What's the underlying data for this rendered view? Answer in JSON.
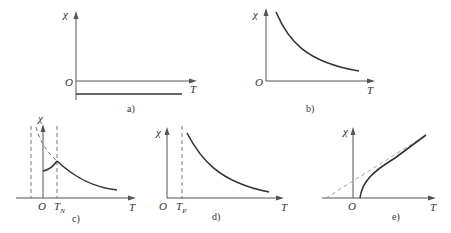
{
  "figure": {
    "panels": [
      {
        "id": "a",
        "caption": "a)",
        "y_label": "χ",
        "x_label": "T",
        "origin_label": "O",
        "description": "Diamagnetic: constant negative susceptibility"
      },
      {
        "id": "b",
        "caption": "b)",
        "y_label": "χ",
        "x_label": "T",
        "origin_label": "O",
        "description": "Paramagnetic: χ decreases with T (Curie law)"
      },
      {
        "id": "c",
        "caption": "c)",
        "y_label": "χ",
        "x_label": "T",
        "origin_label": "O",
        "marker_label": "T",
        "marker_sub": "N",
        "description": "Antiferromagnetic: peak at Néel temperature"
      },
      {
        "id": "d",
        "caption": "d)",
        "y_label": "χ",
        "x_label": "T",
        "origin_label": "O",
        "marker_label": "T",
        "marker_sub": "P",
        "description": "Ferromagnetic above Curie point Tp"
      },
      {
        "id": "e",
        "caption": "e)",
        "y_label": "χ",
        "x_label": "T",
        "origin_label": "O",
        "description": "1/χ vs T, asymptote extrapolated with dashed line"
      }
    ]
  },
  "colors": {
    "axis": "#555555",
    "curve": "#333333",
    "dashed": "#666666"
  }
}
